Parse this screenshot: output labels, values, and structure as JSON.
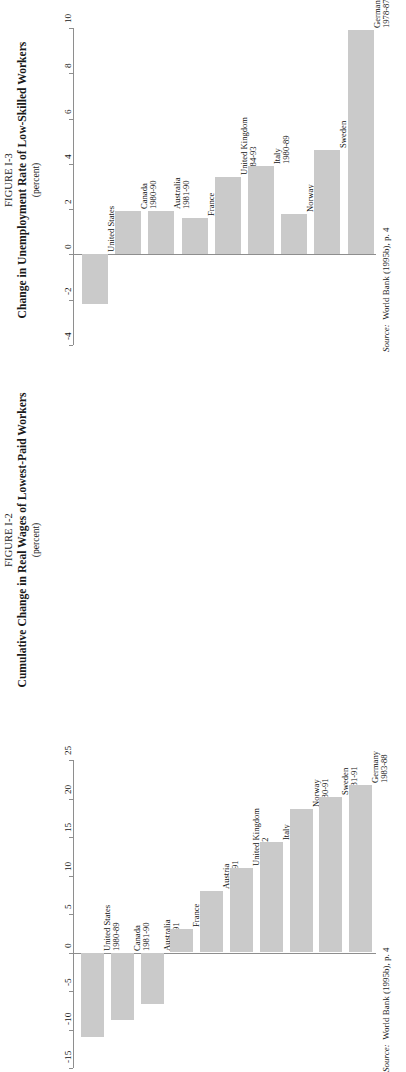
{
  "page": {
    "background": "#ffffff",
    "bar_color": "#cacaca",
    "axis_color": "#8e8e8e",
    "text_color": "#1a1a1a"
  },
  "figures": [
    {
      "id": "figure-1-3",
      "number": "FIGURE I-3",
      "title": "Change in Unemployment Rate of Low-Skilled Workers",
      "units": "(percent)",
      "source_prefix": "Source:",
      "source_text": "World Bank (1995b), p. 4",
      "chart_data": {
        "type": "bar",
        "title": "Change in Unemployment Rate of Low-Skilled Workers",
        "subtitle": "FIGURE I-3",
        "xlabel": "",
        "ylabel": "percent",
        "ylim": [
          -4,
          10
        ],
        "yticks": [
          -4,
          -2,
          0,
          2,
          4,
          6,
          8,
          10
        ],
        "ytick_labels": [
          "-4",
          "-2",
          "0",
          "2",
          "4",
          "6",
          "8",
          "10"
        ],
        "grid": false,
        "legend": "none",
        "orientation": "rotated-90",
        "categories": [
          "United States",
          "Canada",
          "Australia",
          "France",
          "United Kingdom",
          "Italy",
          "Norway",
          "Sweden",
          "Germany"
        ],
        "period_labels": [
          "1980-90",
          "1980-90",
          "1981-90",
          "1982-91",
          "1984-93",
          "1980-89",
          "1980-91",
          "1980-92",
          "1978-87"
        ],
        "values": [
          -2.2,
          1.9,
          1.9,
          1.6,
          3.4,
          3.9,
          1.8,
          4.6,
          9.9
        ]
      }
    },
    {
      "id": "figure-1-2",
      "number": "FIGURE I-2",
      "title": "Cumulative Change in Real Wages of Lowest-Paid Workers",
      "units": "(percent)",
      "source_prefix": "Source:",
      "source_text": "World Bank (1995b), p. 4",
      "chart_data": {
        "type": "bar",
        "title": "Cumulative Change in Real Wages of Lowest-Paid Workers",
        "subtitle": "FIGURE I-2",
        "xlabel": "",
        "ylabel": "percent",
        "ylim": [
          -15,
          25
        ],
        "yticks": [
          -15,
          -10,
          -5,
          0,
          5,
          10,
          15,
          20,
          25
        ],
        "ytick_labels": [
          "-15",
          "-10",
          "-5",
          "0",
          "5",
          "10",
          "15",
          "20",
          "25"
        ],
        "grid": false,
        "legend": "none",
        "orientation": "rotated-90",
        "categories": [
          "United States",
          "Canada",
          "Australia",
          "France",
          "Austria",
          "United Kingdom",
          "Italy",
          "Norway",
          "Sweden",
          "Germany"
        ],
        "period_labels": [
          "1980-89",
          "1981-90",
          "1980-91",
          "1980-87",
          "1980-91",
          "1980-92",
          "1980-87",
          "1980-91",
          "1981-91",
          "1983-88"
        ],
        "values": [
          -11.0,
          -8.8,
          -6.7,
          3.0,
          8.0,
          11.0,
          14.3,
          18.7,
          20.2,
          21.7
        ]
      }
    }
  ]
}
